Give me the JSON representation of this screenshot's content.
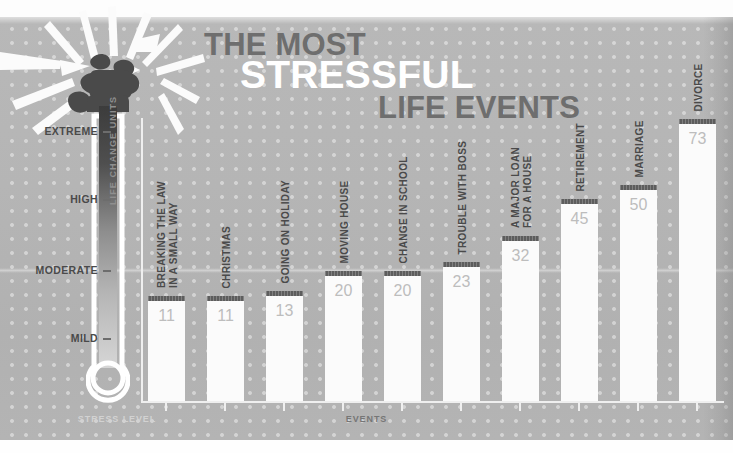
{
  "poster": {
    "title_line1": "THE MOST",
    "title_line2": "STRESSFUL",
    "title_line3": "LIFE EVENTS",
    "y_axis_caption": "LIFE CHANGE UNITS",
    "x_axis_caption": "EVENTS",
    "thermometer_caption": "STRESS LEVEL",
    "colors": {
      "background": "#b5b5b5",
      "bar_fill": "#fbfbfb",
      "bar_cap": "#5d5d5d",
      "value_text": "#bdbdbd",
      "label_text": "#4a4a4a",
      "title_dark": "#6e6e6e",
      "title_light": "#ffffff",
      "icon_circle": "#4e4e4e"
    }
  },
  "scale": {
    "levels": [
      {
        "label": "EXTREME",
        "y": 131
      },
      {
        "label": "HIGH",
        "y": 199
      },
      {
        "label": "MODERATE",
        "y": 270
      },
      {
        "label": "MILD",
        "y": 338
      }
    ]
  },
  "chart_data": {
    "type": "bar",
    "title": "THE MOST STRESSFUL LIFE EVENTS",
    "xlabel": "EVENTS",
    "ylabel": "LIFE CHANGE UNITS",
    "ylim": [
      0,
      80
    ],
    "grid": false,
    "legend": "none",
    "categories": [
      "BREAKING THE LAW IN A SMALL WAY",
      "CHRISTMAS",
      "GOING ON HOLIDAY",
      "MOVING HOUSE",
      "CHANGE IN SCHOOL",
      "TROUBLE WITH BOSS",
      "A MAJOR LOAN FOR A HOUSE",
      "RETIREMENT",
      "MARRIAGE",
      "DIVORCE"
    ],
    "values": [
      11,
      11,
      13,
      20,
      20,
      23,
      32,
      45,
      50,
      73
    ]
  },
  "bars": [
    {
      "value": "11",
      "label_lines": [
        "BREAKING THE LAW",
        "IN A SMALL WAY"
      ],
      "icon": "police-officer-icon",
      "x": 148,
      "top": 296
    },
    {
      "value": "11",
      "label_lines": [
        "CHRISTMAS"
      ],
      "icon": "gift-icon",
      "x": 207,
      "top": 296
    },
    {
      "value": "13",
      "label_lines": [
        "GOING ON HOLIDAY"
      ],
      "icon": "airplane-icon",
      "x": 266,
      "top": 291
    },
    {
      "value": "20",
      "label_lines": [
        "MOVING HOUSE"
      ],
      "icon": "house-icon",
      "x": 325,
      "top": 271
    },
    {
      "value": "20",
      "label_lines": [
        "CHANGE IN SCHOOL"
      ],
      "icon": "graduation-cap-icon",
      "x": 384,
      "top": 271
    },
    {
      "value": "23",
      "label_lines": [
        "TROUBLE WITH BOSS"
      ],
      "icon": "businessman-icon",
      "x": 443,
      "top": 262
    },
    {
      "value": "32",
      "label_lines": [
        "A MAJOR LOAN",
        "FOR A HOUSE"
      ],
      "icon": "bank-money-icon",
      "x": 502,
      "top": 236
    },
    {
      "value": "45",
      "label_lines": [
        "RETIREMENT"
      ],
      "icon": "certificate-icon",
      "x": 561,
      "top": 199
    },
    {
      "value": "50",
      "label_lines": [
        "MARRIAGE"
      ],
      "icon": "wedding-rings-icon",
      "x": 620,
      "top": 185
    },
    {
      "value": "73",
      "label_lines": [
        "DIVORCE"
      ],
      "icon": "broken-heart-icon",
      "x": 679,
      "top": 119
    }
  ]
}
